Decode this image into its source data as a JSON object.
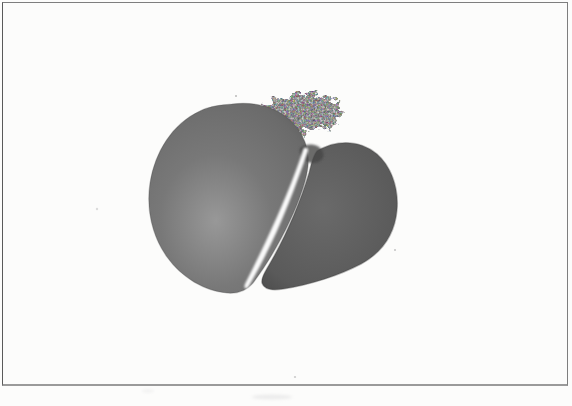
{
  "figure": {
    "alt": "Low-power grayscale photomicrograph of a bilobed tissue section separated by a pale diagonal fissure, printed on a white page inside a thin rectangular frame",
    "colors": {
      "paper": "#fcfcfb",
      "frame_border": "#7e7e7e",
      "frame_border_bottom": "#9a9a9a",
      "frame_border_left": "#5a5a5a",
      "lobe_left_center": "#989898",
      "lobe_left": "#787878",
      "lobe_left_edge": "#5f5f5f",
      "lobe_right_center": "#6a6a6a",
      "lobe_right": "#5a5a5a",
      "lobe_right_edge": "#454545",
      "fissure": "#ffffff",
      "fringe": "#b9b9b9",
      "junction_knot": "#474747",
      "speck_light": "#dcdcdc",
      "speck_dark": "#9c9c9c",
      "smudge": "#ececec"
    }
  }
}
